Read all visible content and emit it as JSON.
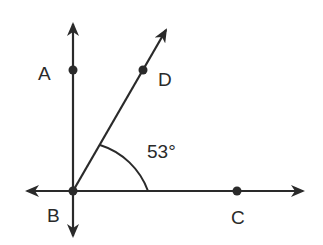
{
  "diagram": {
    "type": "geometry-angle",
    "points": {
      "A": {
        "label": "A",
        "x": 73,
        "y": 70
      },
      "B": {
        "label": "B",
        "x": 73,
        "y": 191
      },
      "C": {
        "label": "C",
        "x": 237,
        "y": 191
      },
      "D": {
        "label": "D",
        "x": 143,
        "y": 70
      }
    },
    "angle": {
      "label": "53°",
      "vertex": "B",
      "between": [
        "D",
        "C"
      ]
    },
    "colors": {
      "stroke": "#2a2a2a",
      "background": "#ffffff"
    }
  }
}
